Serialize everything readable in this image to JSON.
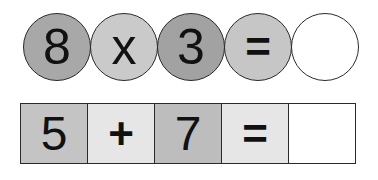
{
  "circle_row": {
    "cells": [
      {
        "text": "8",
        "color": "#a8a8a8"
      },
      {
        "text": "x",
        "color": "#cacaca"
      },
      {
        "text": "3",
        "color": "#a2a2a2"
      },
      {
        "text": "=",
        "color": "#c6c6c6"
      },
      {
        "text": "",
        "color": "#ffffff"
      }
    ]
  },
  "box_row": {
    "cells": [
      {
        "text": "5",
        "color": "#c4c4c4"
      },
      {
        "text": "+",
        "color": "#e6e6e6"
      },
      {
        "text": "7",
        "color": "#bdbdbd"
      },
      {
        "text": "=",
        "color": "#e6e6e6"
      },
      {
        "text": "",
        "color": "#ffffff"
      }
    ]
  }
}
